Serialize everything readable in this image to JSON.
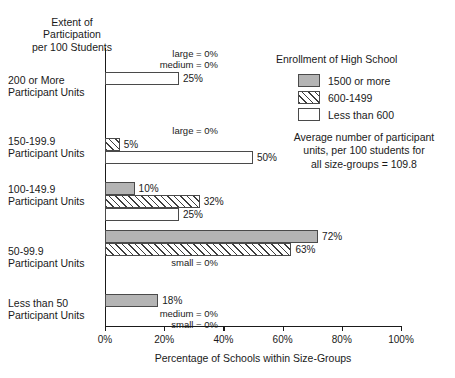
{
  "axis_heading": "Extent of\nParticipation\nper 100 Students",
  "xlabel": "Percentage of Schools within Size-Groups",
  "legend": {
    "title": "Enrollment of High School",
    "items": [
      {
        "key": "large",
        "label": "1500 or more"
      },
      {
        "key": "medium",
        "label": "600-1499"
      },
      {
        "key": "small",
        "label": "Less than 600"
      }
    ]
  },
  "average_note": "Average number of participant\nunits, per 100 students for\nall size-groups = 109.8",
  "ticks": [
    {
      "value": 0,
      "label": "0%"
    },
    {
      "value": 20,
      "label": "20%"
    },
    {
      "value": 40,
      "label": "40%"
    },
    {
      "value": 60,
      "label": "60%"
    },
    {
      "value": 80,
      "label": "80%"
    },
    {
      "value": 100,
      "label": "100%"
    }
  ],
  "groups": [
    {
      "label": "200 or More\nParticipant Units",
      "notes": [
        "large = 0%",
        "medium = 0%"
      ],
      "bars": [
        {
          "key": "small",
          "value": 25,
          "label": "25%"
        }
      ]
    },
    {
      "label": "150-199.9\nParticipant Units",
      "notes": [
        "large = 0%"
      ],
      "bars": [
        {
          "key": "medium",
          "value": 5,
          "label": "5%"
        },
        {
          "key": "small",
          "value": 50,
          "label": "50%"
        }
      ]
    },
    {
      "label": "100-149.9\nParticipant Units",
      "notes": [],
      "bars": [
        {
          "key": "large",
          "value": 10,
          "label": "10%"
        },
        {
          "key": "medium",
          "value": 32,
          "label": "32%"
        },
        {
          "key": "small",
          "value": 25,
          "label": "25%"
        }
      ]
    },
    {
      "label": "50-99.9\nParticipant Units",
      "notes": [
        "small = 0%"
      ],
      "bars": [
        {
          "key": "large",
          "value": 72,
          "label": "72%"
        },
        {
          "key": "medium",
          "value": 63,
          "label": "63%"
        }
      ]
    },
    {
      "label": "Less than 50\nParticipant Units",
      "notes": [
        "medium = 0%",
        "small = 0%"
      ],
      "bars": [
        {
          "key": "large",
          "value": 18,
          "label": "18%"
        }
      ]
    }
  ],
  "chart_data": {
    "type": "bar",
    "orientation": "horizontal",
    "title": "",
    "xlabel": "Percentage of Schools within Size-Groups",
    "ylabel": "Extent of Participation per 100 Students",
    "xlim": [
      0,
      100
    ],
    "xticks": [
      0,
      20,
      40,
      60,
      80,
      100
    ],
    "xtick_labels": [
      "0%",
      "20%",
      "40%",
      "60%",
      "80%",
      "100%"
    ],
    "grid": false,
    "legend_position": "top-right",
    "categories": [
      "200 or More Participant Units",
      "150-199.9 Participant Units",
      "100-149.9 Participant Units",
      "50-99.9 Participant Units",
      "Less than 50 Participant Units"
    ],
    "series": [
      {
        "name": "1500 or more",
        "key": "large",
        "values": [
          0,
          0,
          10,
          72,
          18
        ]
      },
      {
        "name": "600-1499",
        "key": "medium",
        "values": [
          0,
          5,
          32,
          63,
          0
        ]
      },
      {
        "name": "Less than 600",
        "key": "small",
        "values": [
          25,
          50,
          25,
          0,
          0
        ]
      }
    ],
    "annotations": [
      "Average number of participant units, per 100 students for all size-groups = 109.8"
    ]
  }
}
